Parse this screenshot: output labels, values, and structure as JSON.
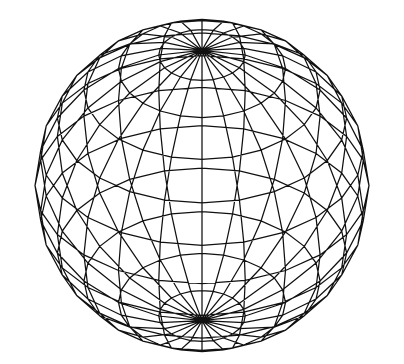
{
  "figure": {
    "type": "wireframe-uv-sphere",
    "background": "#ffffff",
    "line_color": "#111111",
    "line_width": 1.25,
    "center": [
      202,
      185.5
    ],
    "radius": 167,
    "latitude_segments": 12,
    "longitude_segments": 24,
    "tilt_degrees": 36,
    "show_hidden_edges": true
  }
}
